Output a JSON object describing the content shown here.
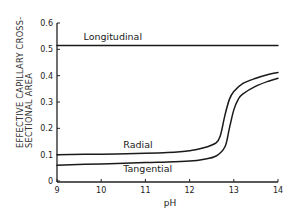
{
  "chart_data": {
    "type": "line",
    "title": "",
    "xlabel": "pH",
    "ylabel": [
      "EFFECTIVE CAPILLARY CROSS-",
      "SECTIONAL AREA"
    ],
    "xlim": [
      9,
      14
    ],
    "ylim": [
      0,
      0.6
    ],
    "x_ticks": [
      9,
      10,
      11,
      12,
      13,
      14
    ],
    "x_tick_labels": [
      "9",
      "10",
      "11",
      "12",
      "13",
      "14"
    ],
    "y_ticks": [
      0,
      0.1,
      0.2,
      0.3,
      0.4,
      0.5,
      0.6
    ],
    "y_tick_labels": [
      "0",
      "0.1",
      "0.2",
      "0.3",
      "0.4",
      "0.5",
      "0.6"
    ],
    "grid": false,
    "legend": "none (curves labeled inline)",
    "series": [
      {
        "name": "Longitudinal",
        "label_pos": {
          "x": 9.6,
          "y": 0.535
        },
        "x": [
          9,
          10,
          11,
          12,
          13,
          14
        ],
        "values": [
          0.515,
          0.515,
          0.515,
          0.515,
          0.515,
          0.515
        ]
      },
      {
        "name": "Radial",
        "label_pos": {
          "x": 10.5,
          "y": 0.125
        },
        "x": [
          9,
          10,
          11,
          11.5,
          12,
          12.3,
          12.6,
          12.7,
          12.8,
          12.9,
          13.0,
          13.2,
          13.5,
          13.8,
          14
        ],
        "values": [
          0.1,
          0.102,
          0.105,
          0.108,
          0.115,
          0.125,
          0.145,
          0.175,
          0.25,
          0.31,
          0.34,
          0.37,
          0.39,
          0.405,
          0.412
        ]
      },
      {
        "name": "Tangential",
        "label_pos": {
          "x": 10.5,
          "y": 0.035
        },
        "x": [
          9,
          10,
          11,
          11.5,
          12,
          12.3,
          12.6,
          12.8,
          12.9,
          13.0,
          13.1,
          13.2,
          13.5,
          13.8,
          14
        ],
        "values": [
          0.06,
          0.065,
          0.07,
          0.072,
          0.076,
          0.082,
          0.095,
          0.13,
          0.2,
          0.27,
          0.31,
          0.33,
          0.36,
          0.38,
          0.39
        ]
      }
    ]
  }
}
